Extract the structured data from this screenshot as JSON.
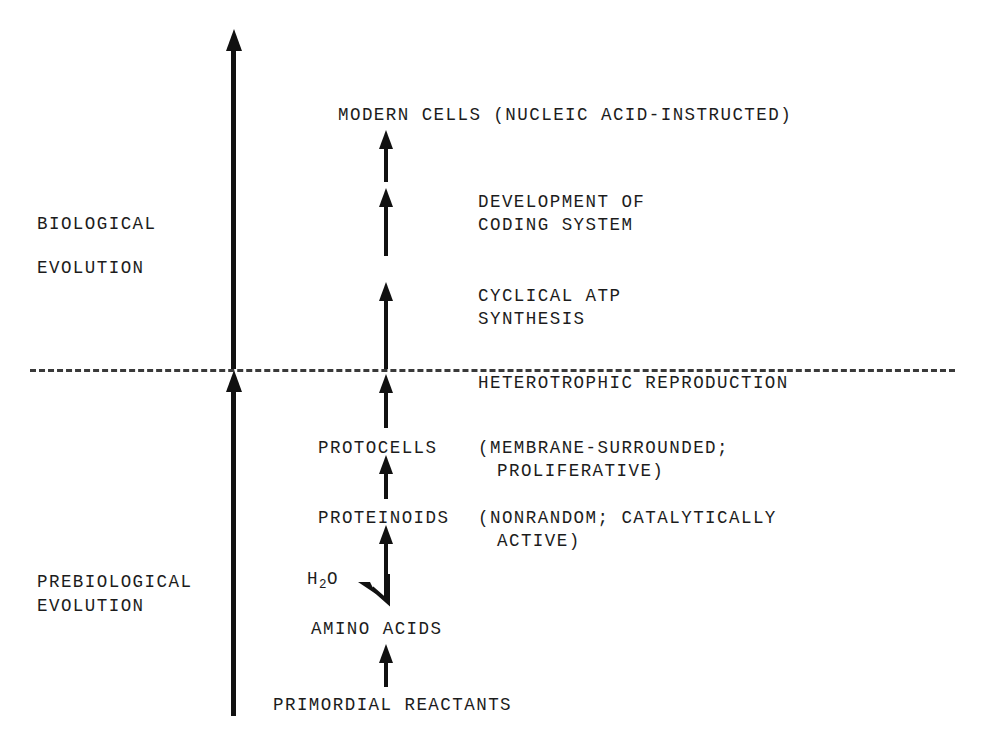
{
  "figure": {
    "background_color": "#ffffff",
    "ink_color": "#111111"
  },
  "phase_labels": {
    "biological": {
      "line1": "BIOLOGICAL",
      "line2": "EVOLUTION"
    },
    "prebiological": {
      "line1": "PREBIOLOGICAL",
      "line2": "EVOLUTION"
    }
  },
  "divider": {
    "label": "HETEROTROPHIC REPRODUCTION",
    "style": "dashed"
  },
  "stages": {
    "modern_cells": "MODERN CELLS (NUCLEIC ACID-INSTRUCTED)",
    "development_of_coding_system": {
      "line1": "DEVELOPMENT OF",
      "line2": "CODING SYSTEM"
    },
    "cyclical_atp_synthesis": {
      "line1": "CYCLICAL ATP",
      "line2": "SYNTHESIS"
    },
    "protocells": {
      "name": "PROTOCELLS",
      "note_line1": "(MEMBRANE-SURROUNDED;",
      "note_line2": "PROLIFERATIVE)"
    },
    "proteinoids": {
      "name": "PROTEINOIDS",
      "note_line1": "(NONRANDOM; CATALYTICALLY",
      "note_line2": "ACTIVE)"
    },
    "water": {
      "formula_main": "H",
      "formula_sub": "2",
      "formula_tail": "O"
    },
    "amino_acids": "AMINO ACIDS",
    "primordial_reactants": "PRIMORDIAL REACTANTS"
  }
}
